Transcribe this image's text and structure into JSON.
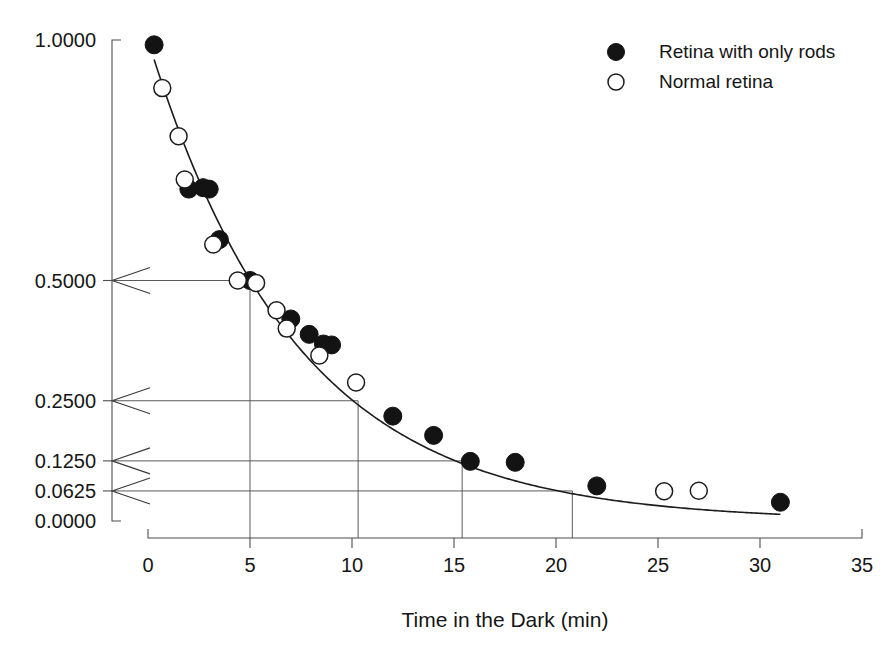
{
  "figure": {
    "top_cropped_caption": "",
    "background_color": "#ffffff",
    "ink_color": "#131313"
  },
  "chart_data": {
    "type": "scatter",
    "title": "",
    "xlabel": "Time in the Dark (min)",
    "ylabel": "",
    "xlim": [
      0,
      35
    ],
    "ylim": [
      0,
      1
    ],
    "grid": false,
    "xticks": [
      0,
      5,
      10,
      15,
      20,
      25,
      30,
      35
    ],
    "xtick_labels": [
      "0",
      "5",
      "10",
      "15",
      "20",
      "25",
      "30",
      "35"
    ],
    "yticks": [
      0.0,
      0.0625,
      0.125,
      0.25,
      0.5,
      1.0
    ],
    "ytick_labels": [
      "0.0000",
      "0.0625",
      "0.1250",
      "0.2500",
      "0.5000",
      "1.0000"
    ],
    "legend_position": "upper right",
    "series": [
      {
        "name": "Retina with only rods",
        "marker": "filled-circle",
        "color": "#131313",
        "points": [
          [
            0.3,
            0.99
          ],
          [
            2.0,
            0.69
          ],
          [
            2.7,
            0.693
          ],
          [
            3.0,
            0.69
          ],
          [
            3.5,
            0.585
          ],
          [
            5.0,
            0.5
          ],
          [
            7.0,
            0.42
          ],
          [
            7.9,
            0.388
          ],
          [
            8.6,
            0.368
          ],
          [
            9.0,
            0.366
          ],
          [
            12.0,
            0.218
          ],
          [
            14.0,
            0.178
          ],
          [
            15.8,
            0.124
          ],
          [
            18.0,
            0.122
          ],
          [
            22.0,
            0.073
          ],
          [
            31.0,
            0.039
          ]
        ]
      },
      {
        "name": "Normal retina",
        "marker": "open-circle",
        "color": "#ffffff",
        "points": [
          [
            0.7,
            0.9
          ],
          [
            1.5,
            0.8
          ],
          [
            1.8,
            0.71
          ],
          [
            3.2,
            0.575
          ],
          [
            4.4,
            0.5
          ],
          [
            5.3,
            0.495
          ],
          [
            6.3,
            0.438
          ],
          [
            6.8,
            0.4
          ],
          [
            8.4,
            0.344
          ],
          [
            10.2,
            0.288
          ],
          [
            25.3,
            0.062
          ],
          [
            27.0,
            0.063
          ]
        ]
      }
    ],
    "fit_curve": {
      "name": "exponential decay fit",
      "model": "y = exp(-t / 7.25)",
      "t_start": 0.3,
      "t_end": 31.0
    },
    "annotations": [
      {
        "kind": "half-life-guide",
        "y_value": 0.5,
        "y_label": "0.5000",
        "t_value": 5.0,
        "arrow_at_axis": true,
        "drop_line": true
      },
      {
        "kind": "half-life-guide",
        "y_value": 0.25,
        "y_label": "0.2500",
        "t_value": 10.3,
        "arrow_at_axis": true,
        "drop_line": true
      },
      {
        "kind": "half-life-guide",
        "y_value": 0.125,
        "y_label": "0.1250",
        "t_value": 15.4,
        "arrow_at_axis": true,
        "drop_line": true
      },
      {
        "kind": "half-life-guide",
        "y_value": 0.0625,
        "y_label": "0.0625",
        "t_value": 20.8,
        "arrow_at_axis": true,
        "drop_line": true
      }
    ]
  },
  "legend": {
    "entries": [
      {
        "label": "Retina with only rods",
        "marker": "filled-circle"
      },
      {
        "label": "Normal retina",
        "marker": "open-circle"
      }
    ]
  }
}
